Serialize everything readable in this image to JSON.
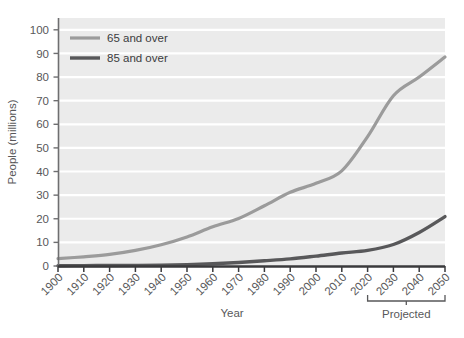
{
  "chart_data": {
    "type": "line",
    "title": "",
    "xlabel": "Year",
    "ylabel": "People (millions)",
    "xlim": [
      1900,
      2050
    ],
    "ylim": [
      0,
      105
    ],
    "grid": true,
    "grid_orientation": "horizontal",
    "legend_position": "top-left",
    "plot_background": "#ebebeb",
    "gridline_color": "#ffffff",
    "categories": [
      1900,
      1910,
      1920,
      1930,
      1940,
      1950,
      1960,
      1970,
      1980,
      1990,
      2000,
      2010,
      2020,
      2030,
      2040,
      2050
    ],
    "x_tick_labels": [
      "1900",
      "1910",
      "1920",
      "1930",
      "1940",
      "1950",
      "1960",
      "1970",
      "1980",
      "1990",
      "2000",
      "2010",
      "2020",
      "2030",
      "2040",
      "2050"
    ],
    "y_tick_labels": [
      "0",
      "10",
      "20",
      "30",
      "40",
      "50",
      "60",
      "70",
      "80",
      "90",
      "100"
    ],
    "y_ticks": [
      0,
      10,
      20,
      30,
      40,
      50,
      60,
      70,
      80,
      90,
      100
    ],
    "series": [
      {
        "name": "65 and over",
        "color": "#9b9b9b",
        "width": 3.2,
        "values": [
          3.1,
          3.9,
          4.9,
          6.6,
          9.0,
          12.3,
          16.6,
          20.1,
          25.5,
          31.2,
          35.0,
          40.3,
          54.8,
          72.1,
          80.0,
          88.5
        ]
      },
      {
        "name": "85 and over",
        "color": "#58585a",
        "width": 3.4,
        "values": [
          0.12,
          0.17,
          0.21,
          0.27,
          0.37,
          0.58,
          0.94,
          1.5,
          2.2,
          3.0,
          4.2,
          5.5,
          6.6,
          9.1,
          14.2,
          20.9
        ]
      }
    ],
    "annotations": [
      {
        "name": "projected-bracket",
        "label": "Projected",
        "from_year": 2020,
        "to_year": 2050
      }
    ]
  },
  "legend": {
    "items": [
      {
        "label": "65 and over"
      },
      {
        "label": "85 and over"
      }
    ]
  },
  "axes": {
    "x_title": "Year",
    "y_title": "People (millions)"
  },
  "annotation": {
    "projected_label": "Projected"
  }
}
